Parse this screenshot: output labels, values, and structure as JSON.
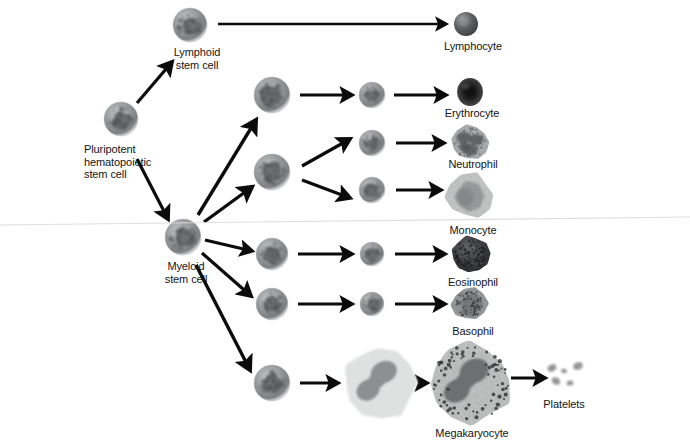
{
  "figure": {
    "background_color": "#ffffff",
    "width": 690,
    "height": 444
  },
  "cells": [
    {
      "id": "pluripotent-stem-cell",
      "label": "Pluripotent\nhematopoietic\nstem cell",
      "label_align": "left",
      "label_x": 84,
      "label_y": 143,
      "x": 121,
      "y": 119,
      "r": 17,
      "kind": "stem",
      "color": "#8d9090"
    },
    {
      "id": "lymphoid-stem-cell",
      "label": "Lymphoid\nstem cell",
      "label_align": "center",
      "label_x": 197,
      "label_y": 46,
      "x": 190,
      "y": 25,
      "r": 17,
      "kind": "stem",
      "color": "#8a8d8d"
    },
    {
      "id": "myeloid-stem-cell",
      "label": "Myeloid\nstem cell",
      "label_align": "center",
      "label_x": 186,
      "label_y": 260,
      "x": 183,
      "y": 237,
      "r": 18,
      "kind": "stem",
      "color": "#83868a"
    },
    {
      "id": "proerythroblast",
      "label": "",
      "x": 272,
      "y": 95,
      "r": 18,
      "kind": "stem",
      "color": "#8a8d8d"
    },
    {
      "id": "myeloblast-shared",
      "label": "",
      "x": 272,
      "y": 172,
      "r": 18,
      "kind": "stem",
      "color": "#8a8d8d"
    },
    {
      "id": "eosinophil-precursor",
      "label": "",
      "x": 272,
      "y": 254,
      "r": 16,
      "kind": "stem",
      "color": "#86898c"
    },
    {
      "id": "basophil-precursor",
      "label": "",
      "x": 272,
      "y": 304,
      "r": 16,
      "kind": "stem",
      "color": "#86898c"
    },
    {
      "id": "megakaryoblast",
      "label": "",
      "x": 272,
      "y": 383,
      "r": 18,
      "kind": "stem",
      "color": "#83868a"
    },
    {
      "id": "normoblast",
      "label": "",
      "x": 372,
      "y": 95,
      "r": 13,
      "kind": "stem",
      "color": "#8f9294"
    },
    {
      "id": "neutrophil-precursor",
      "label": "",
      "x": 372,
      "y": 143,
      "r": 13,
      "kind": "stem",
      "color": "#8a8d8f"
    },
    {
      "id": "monocyte-precursor",
      "label": "",
      "x": 372,
      "y": 190,
      "r": 13,
      "kind": "stem",
      "color": "#8a8d8f"
    },
    {
      "id": "eosinophil-precursor-2",
      "label": "",
      "x": 372,
      "y": 254,
      "r": 12,
      "kind": "stem",
      "color": "#8a8d8f"
    },
    {
      "id": "basophil-precursor-2",
      "label": "",
      "x": 372,
      "y": 304,
      "r": 12,
      "kind": "stem",
      "color": "#8a8d8f"
    },
    {
      "id": "promegakaryocyte",
      "label": "",
      "x": 380,
      "y": 383,
      "r": 37,
      "kind": "megakaryocyte-pale",
      "color": "#d2d4d4"
    },
    {
      "id": "lymphocyte",
      "label": "Lymphocyte",
      "label_align": "center",
      "label_x": 473,
      "label_y": 40,
      "x": 466,
      "y": 24,
      "r": 12,
      "kind": "lymphocyte",
      "color": "#56595a"
    },
    {
      "id": "erythrocyte",
      "label": "Erythrocyte",
      "label_align": "center",
      "label_x": 472,
      "label_y": 107,
      "x": 470,
      "y": 92,
      "r": 14,
      "kind": "erythrocyte",
      "color": "#3b3b3c"
    },
    {
      "id": "neutrophil",
      "label": "Neutrophil",
      "label_align": "center",
      "label_x": 473,
      "label_y": 158,
      "x": 470,
      "y": 143,
      "r": 18,
      "kind": "granulocyte-light",
      "color": "#a8aaab"
    },
    {
      "id": "monocyte",
      "label": "Monocyte",
      "label_align": "center",
      "label_x": 473,
      "label_y": 224,
      "x": 470,
      "y": 196,
      "r": 23,
      "kind": "monocyte",
      "color": "#bfc1c1"
    },
    {
      "id": "eosinophil",
      "label": "Eosinophil",
      "label_align": "center",
      "label_x": 473,
      "label_y": 276,
      "x": 470,
      "y": 254,
      "r": 19,
      "kind": "eosinophil",
      "color": "#494a4b"
    },
    {
      "id": "basophil",
      "label": "Basophil",
      "label_align": "center",
      "label_x": 473,
      "label_y": 325,
      "x": 470,
      "y": 304,
      "r": 17,
      "kind": "basophil",
      "color": "#8e9092"
    },
    {
      "id": "megakaryocyte",
      "label": "Megakaryocyte",
      "label_align": "center",
      "label_x": 472,
      "label_y": 427,
      "x": 470,
      "y": 383,
      "r": 41,
      "kind": "megakaryocyte",
      "color": "#c3c5c4"
    },
    {
      "id": "platelets",
      "label": "Platelets",
      "label_align": "center",
      "label_x": 564,
      "label_y": 398,
      "x": 564,
      "y": 375,
      "r": 0,
      "kind": "platelets",
      "color": "#8f9192"
    }
  ],
  "arrows": [
    {
      "id": "arrow-pluripotent-to-lymphoid",
      "from": [
        137,
        103
      ],
      "to": [
        172,
        62
      ],
      "width": 3.2
    },
    {
      "id": "arrow-pluripotent-to-myeloid",
      "from": [
        137,
        159
      ],
      "to": [
        168,
        219
      ],
      "width": 3.2
    },
    {
      "id": "arrow-lymphoid-to-lymphocyte",
      "from": [
        218,
        24
      ],
      "to": [
        446,
        24
      ],
      "width": 2.6
    },
    {
      "id": "arrow-myeloid-to-proerythro",
      "from": [
        198,
        215
      ],
      "to": [
        256,
        120
      ],
      "width": 3.4
    },
    {
      "id": "arrow-myeloid-to-myeloblast",
      "from": [
        204,
        222
      ],
      "to": [
        252,
        187
      ],
      "width": 3.4
    },
    {
      "id": "arrow-myeloid-to-eosino-pre",
      "from": [
        205,
        240
      ],
      "to": [
        252,
        251
      ],
      "width": 3.0
    },
    {
      "id": "arrow-myeloid-to-baso-pre",
      "from": [
        202,
        253
      ],
      "to": [
        251,
        296
      ],
      "width": 3.2
    },
    {
      "id": "arrow-myeloid-to-megakaryoblast",
      "from": [
        196,
        265
      ],
      "to": [
        250,
        370
      ],
      "width": 3.4
    },
    {
      "id": "arrow-proerythro-to-normoblast",
      "from": [
        300,
        95
      ],
      "to": [
        352,
        95
      ],
      "width": 3.0
    },
    {
      "id": "arrow-normoblast-to-erythrocyte",
      "from": [
        394,
        95
      ],
      "to": [
        446,
        95
      ],
      "width": 3.0
    },
    {
      "id": "arrow-myeloblast-to-neutro-pre",
      "from": [
        302,
        166
      ],
      "to": [
        350,
        139
      ],
      "width": 3.2
    },
    {
      "id": "arrow-myeloblast-to-mono-pre",
      "from": [
        302,
        180
      ],
      "to": [
        350,
        198
      ],
      "width": 3.2
    },
    {
      "id": "arrow-neutro-pre-to-neutrophil",
      "from": [
        396,
        143
      ],
      "to": [
        444,
        143
      ],
      "width": 3.0
    },
    {
      "id": "arrow-mono-pre-to-monocyte",
      "from": [
        396,
        190
      ],
      "to": [
        441,
        190
      ],
      "width": 3.0
    },
    {
      "id": "arrow-eos-pre-to-eos-pre2",
      "from": [
        298,
        254
      ],
      "to": [
        352,
        254
      ],
      "width": 3.0
    },
    {
      "id": "arrow-eos-pre2-to-eosinophil",
      "from": [
        395,
        254
      ],
      "to": [
        445,
        254
      ],
      "width": 3.0
    },
    {
      "id": "arrow-baso-pre-to-baso-pre2",
      "from": [
        298,
        304
      ],
      "to": [
        352,
        304
      ],
      "width": 3.0
    },
    {
      "id": "arrow-baso-pre2-to-basophil",
      "from": [
        395,
        304
      ],
      "to": [
        445,
        304
      ],
      "width": 3.0
    },
    {
      "id": "arrow-megakaryoblast-to-pro",
      "from": [
        300,
        383
      ],
      "to": [
        338,
        383
      ],
      "width": 3.0
    },
    {
      "id": "arrow-pro-to-megakaryocyte",
      "from": [
        422,
        383
      ],
      "to": [
        427,
        383
      ],
      "width": 3.0
    },
    {
      "id": "arrow-megakaryocyte-to-platelets",
      "from": [
        511,
        378
      ],
      "to": [
        545,
        378
      ],
      "width": 3.0
    }
  ],
  "platelet_fragments": [
    {
      "cx": 552,
      "cy": 368,
      "rx": 4.5,
      "ry": 3.4,
      "rot": -28
    },
    {
      "cx": 564,
      "cy": 371,
      "rx": 3.0,
      "ry": 2.2,
      "rot": 12
    },
    {
      "cx": 578,
      "cy": 366,
      "rx": 5.0,
      "ry": 3.8,
      "rot": -20
    },
    {
      "cx": 556,
      "cy": 381,
      "rx": 4.6,
      "ry": 3.6,
      "rot": 30
    },
    {
      "cx": 570,
      "cy": 383,
      "rx": 3.4,
      "ry": 2.6,
      "rot": -10
    }
  ],
  "artifacts": {
    "scan_seam_label": "scanner-seam-line",
    "scan_seam_left_y": 225,
    "scan_seam_right_y": 217,
    "scan_seam_color": "#d9dcdc"
  }
}
